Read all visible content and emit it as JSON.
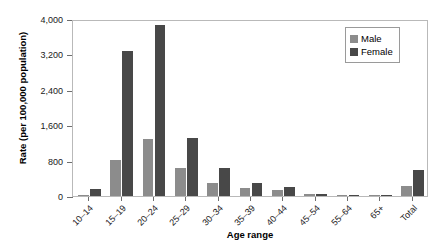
{
  "chart_data": {
    "type": "bar",
    "title": "",
    "xlabel": "Age range",
    "ylabel": "Rate (per 100,000 population)",
    "categories": [
      "10–14",
      "15–19",
      "20–24",
      "25–29",
      "30–34",
      "35–39",
      "40–44",
      "45–54",
      "55–64",
      "65+",
      "Total"
    ],
    "series": [
      {
        "name": "Male",
        "color": "#8c8c8c",
        "values": [
          15,
          820,
          1290,
          640,
          300,
          180,
          145,
          55,
          18,
          4,
          230
        ]
      },
      {
        "name": "Female",
        "color": "#484848",
        "values": [
          148,
          3280,
          3870,
          1300,
          640,
          290,
          200,
          45,
          12,
          2,
          590
        ]
      }
    ],
    "ylim": [
      0,
      4000
    ],
    "yticks": [
      0,
      800,
      1600,
      2400,
      3200,
      4000
    ],
    "ytick_labels": [
      "0",
      "800",
      "1,600",
      "2,400",
      "3,200",
      "4,000"
    ],
    "grid": false,
    "legend_position": "top-right"
  },
  "legend": {
    "entries": [
      {
        "label": "Male"
      },
      {
        "label": "Female"
      }
    ]
  }
}
